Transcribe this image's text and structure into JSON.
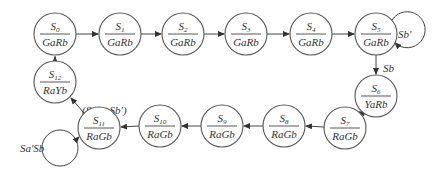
{
  "diagram": {
    "type": "state-machine",
    "states": [
      {
        "id": "S0",
        "name": "S",
        "sub": "0",
        "output": "GaRb",
        "cx": 55,
        "cy": 34
      },
      {
        "id": "S1",
        "name": "S",
        "sub": "1",
        "output": "GaRb",
        "cx": 120,
        "cy": 34
      },
      {
        "id": "S2",
        "name": "S",
        "sub": "2",
        "output": "GaRb",
        "cx": 183,
        "cy": 34
      },
      {
        "id": "S3",
        "name": "S",
        "sub": "3",
        "output": "GaRb",
        "cx": 246,
        "cy": 34
      },
      {
        "id": "S4",
        "name": "S",
        "sub": "4",
        "output": "GaRb",
        "cx": 311,
        "cy": 34
      },
      {
        "id": "S5",
        "name": "S",
        "sub": "5",
        "output": "GaRb",
        "cx": 376,
        "cy": 34
      },
      {
        "id": "S6",
        "name": "S",
        "sub": "6",
        "output": "YaRb",
        "cx": 376,
        "cy": 96
      },
      {
        "id": "S7",
        "name": "S",
        "sub": "7",
        "output": "RaGb",
        "cx": 345,
        "cy": 128
      },
      {
        "id": "S8",
        "name": "S",
        "sub": "8",
        "output": "RaGb",
        "cx": 284,
        "cy": 126
      },
      {
        "id": "S9",
        "name": "S",
        "sub": "9",
        "output": "RaGb",
        "cx": 222,
        "cy": 126
      },
      {
        "id": "S10",
        "name": "S",
        "sub": "10",
        "output": "RaGb",
        "cx": 160,
        "cy": 126
      },
      {
        "id": "S11",
        "name": "S",
        "sub": "11",
        "output": "RaGb",
        "cx": 99,
        "cy": 128
      },
      {
        "id": "S12",
        "name": "S",
        "sub": "12",
        "output": "RaYb",
        "cx": 55,
        "cy": 82
      }
    ],
    "transitions": [
      {
        "from": "S0",
        "to": "S1",
        "label": ""
      },
      {
        "from": "S1",
        "to": "S2",
        "label": ""
      },
      {
        "from": "S2",
        "to": "S3",
        "label": ""
      },
      {
        "from": "S3",
        "to": "S4",
        "label": ""
      },
      {
        "from": "S4",
        "to": "S5",
        "label": ""
      },
      {
        "from": "S5",
        "to": "S5",
        "label": "Sb'"
      },
      {
        "from": "S5",
        "to": "S6",
        "label": "Sb"
      },
      {
        "from": "S6",
        "to": "S7",
        "label": ""
      },
      {
        "from": "S7",
        "to": "S8",
        "label": ""
      },
      {
        "from": "S8",
        "to": "S9",
        "label": ""
      },
      {
        "from": "S9",
        "to": "S10",
        "label": ""
      },
      {
        "from": "S10",
        "to": "S11",
        "label": ""
      },
      {
        "from": "S11",
        "to": "S11",
        "label": "Sa'Sb"
      },
      {
        "from": "S11",
        "to": "S12",
        "label": "(Sa + Sb')"
      },
      {
        "from": "S12",
        "to": "S0",
        "label": ""
      }
    ],
    "edge_labels": {
      "s5_self": "Sb'",
      "s5_s6": "Sb",
      "s11_self": "Sa'Sb",
      "s11_s12": "(Sa + Sb')"
    },
    "colors": {
      "stroke": "#555555",
      "text": "#333333",
      "background": "#ffffff"
    }
  }
}
